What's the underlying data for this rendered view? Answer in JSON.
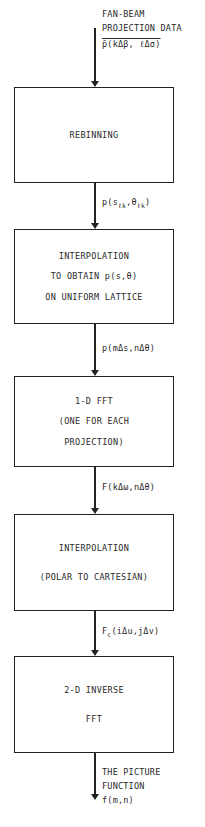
{
  "diagram": {
    "type": "flowchart",
    "direction": "top-to-bottom",
    "input": {
      "label_lines": [
        "FAN-BEAM",
        "PROJECTION DATA"
      ],
      "formula": "p̄(kΔβ, ℓΔσ)"
    },
    "steps": [
      {
        "id": "rebinning",
        "lines": [
          "REBINNING"
        ]
      },
      {
        "id": "interpolation-uniform",
        "lines": [
          "INTERPOLATION",
          "TO OBTAIN p(s,θ)",
          "ON UNIFORM LATTICE"
        ]
      },
      {
        "id": "fft-1d",
        "lines": [
          "1-D FFT",
          "(ONE FOR EACH",
          "PROJECTION)"
        ]
      },
      {
        "id": "interpolation-polar",
        "lines": [
          "INTERPOLATION",
          "(POLAR TO CARTESIAN)"
        ]
      },
      {
        "id": "inverse-fft-2d",
        "lines": [
          "2-D INVERSE",
          "FFT"
        ]
      }
    ],
    "edges": [
      {
        "from": "rebinning",
        "to": "interpolation-uniform",
        "label_main": "p(s",
        "label_sub1": "ℓk",
        "label_mid": ",θ",
        "label_sub2": "ℓk",
        "label_end": ")"
      },
      {
        "from": "interpolation-uniform",
        "to": "fft-1d",
        "label": "p(mΔs,nΔθ)"
      },
      {
        "from": "fft-1d",
        "to": "interpolation-polar",
        "label": "F(kΔω,nΔθ)"
      },
      {
        "from": "interpolation-polar",
        "to": "inverse-fft-2d",
        "label_main": "F",
        "label_sub": "c",
        "label_rest": "(iΔu,jΔv)"
      }
    ],
    "output": {
      "label_lines": [
        "THE PICTURE",
        "FUNCTION"
      ],
      "formula": "f(m,n)"
    }
  }
}
